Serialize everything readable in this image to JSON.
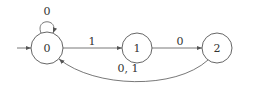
{
  "diagram": {
    "type": "finite-automaton",
    "states": [
      {
        "id": "0",
        "label": "0",
        "initial": true
      },
      {
        "id": "1",
        "label": "1"
      },
      {
        "id": "2",
        "label": "2"
      }
    ],
    "transitions": [
      {
        "from": "0",
        "to": "0",
        "label": "0"
      },
      {
        "from": "0",
        "to": "1",
        "label": "1"
      },
      {
        "from": "1",
        "to": "2",
        "label": "0"
      },
      {
        "from": "2",
        "to": "0",
        "label": "0, 1"
      }
    ],
    "colors": {
      "stroke": "#555555",
      "text": "#333333",
      "background": "#ffffff"
    }
  }
}
